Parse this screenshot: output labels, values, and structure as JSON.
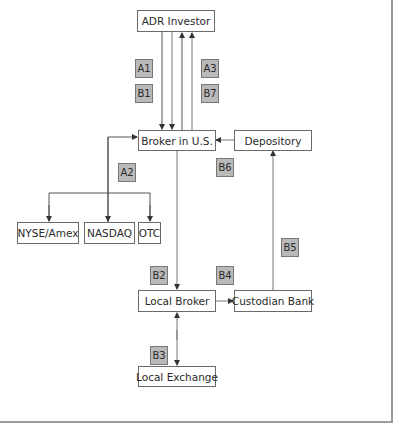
{
  "diagram": {
    "nodes": {
      "adr_investor": "ADR Investor",
      "broker_us": "Broker in U.S.",
      "depository": "Depository",
      "nyse_amex": "NYSE/Amex",
      "nasdaq": "NASDAQ",
      "otc": "OTC",
      "local_broker": "Local Broker",
      "custodian_bank": "Custodian Bank",
      "local_exchange": "Local Exchange"
    },
    "step_labels": {
      "a1": "A1",
      "b1": "B1",
      "a3": "A3",
      "b7": "B7",
      "a2": "A2",
      "b6": "B6",
      "b5": "B5",
      "b2": "B2",
      "b4": "B4",
      "b3": "B3"
    },
    "colors": {
      "tag_fill": "#b9b9b9",
      "line": "#555555",
      "box_border": "#6a6a6a"
    }
  }
}
